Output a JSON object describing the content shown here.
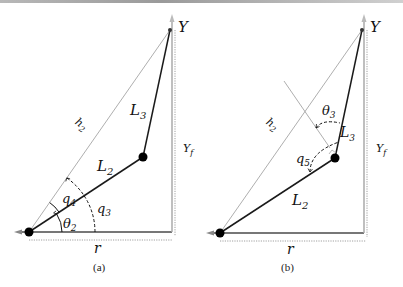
{
  "panels": [
    {
      "id": "a",
      "caption": "(a)",
      "labels": {
        "target": "Y",
        "target_height": "Y_f",
        "target_height_main": "Y",
        "target_height_sub": "f",
        "hypotenuse": "h",
        "hypotenuse_sub": "2",
        "link3": "L",
        "link3_sub": "3",
        "link2": "L",
        "link2_sub": "2",
        "angle_q4": "q",
        "angle_q4_sub": "4",
        "angle_q3": "q",
        "angle_q3_sub": "3",
        "angle_theta2": "θ",
        "angle_theta2_sub": "2",
        "base_distance": "r"
      }
    },
    {
      "id": "b",
      "caption": "(b)",
      "labels": {
        "target": "Y",
        "target_height_main": "Y",
        "target_height_sub": "f",
        "hypotenuse": "h",
        "hypotenuse_sub": "2",
        "link3": "L",
        "link3_sub": "3",
        "link2": "L",
        "link2_sub": "2",
        "angle_theta3": "θ",
        "angle_theta3_sub": "3",
        "angle_q5": "q",
        "angle_q5_sub": "5",
        "base_distance": "r"
      }
    }
  ],
  "colors": {
    "link": "#1a1a1a",
    "guide": "#9a9a9a",
    "dotted": "#8a8a8a",
    "joint": "#000000"
  }
}
